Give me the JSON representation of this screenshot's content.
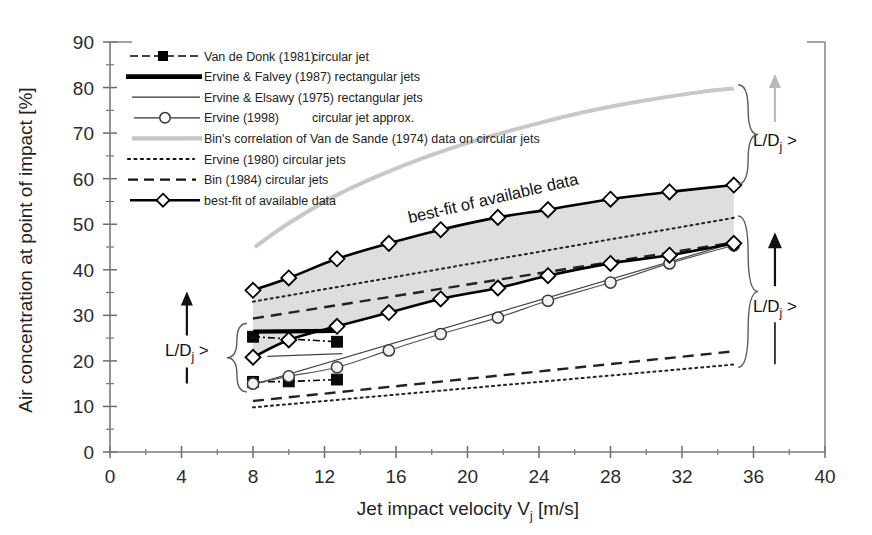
{
  "chart_data": {
    "type": "line",
    "title": "",
    "xlabel": "Jet impact velocity Vj [m/s]",
    "xlabel_main": "Jet impact velocity V",
    "xlabel_sub": "j",
    "xlabel_units": " [m/s]",
    "ylabel": "Air concentration at point of impact [%]",
    "xlim": [
      0,
      40
    ],
    "ylim": [
      0,
      90
    ],
    "xticks": [
      0,
      4,
      8,
      12,
      16,
      20,
      24,
      28,
      32,
      36,
      40
    ],
    "yticks": [
      0,
      10,
      20,
      30,
      40,
      50,
      60,
      70,
      80,
      90
    ],
    "xtick_labels": [
      "0",
      "4",
      "8",
      "12",
      "16",
      "20",
      "24",
      "28",
      "32",
      "36",
      "40"
    ],
    "ytick_labels": [
      "0",
      "10",
      "20",
      "30",
      "40",
      "50",
      "60",
      "70",
      "80",
      "90"
    ],
    "x_minor_step": 2,
    "y_minor_step": 5,
    "grid": false,
    "legend_position": "upper-left inside",
    "annotations": [
      {
        "name": "best-fit-inline-label",
        "text": "best-fit of available data",
        "x": 21.5,
        "y": 54.5,
        "rotation": -13
      },
      {
        "name": "ratio-annotation-left",
        "text": "L/Dj >",
        "text_main": "L/D",
        "text_sub": "j",
        "text_tail": " >",
        "x": 4.3,
        "y": 22.5
      },
      {
        "name": "ratio-annotation-upper-right",
        "text": "L/Dj >",
        "text_main": "L/D",
        "text_sub": "j",
        "text_tail": " >",
        "x": 37.2,
        "y": 68.5
      },
      {
        "name": "ratio-annotation-lower-right",
        "text": "L/Dj >",
        "text_main": "L/D",
        "text_sub": "j",
        "text_tail": " >",
        "x": 37.2,
        "y": 32.0
      }
    ],
    "band": {
      "name": "best-fit-scatter-band",
      "color": "#dcdcdc",
      "upper_x": [
        8.0,
        10.0,
        12.7,
        15.6,
        18.5,
        21.7,
        24.5,
        28.0,
        31.3,
        34.9
      ],
      "upper_y": [
        35.5,
        38.2,
        42.4,
        45.8,
        48.8,
        51.5,
        53.2,
        55.5,
        57.1,
        58.6
      ],
      "lower_x": [
        8.0,
        10.0,
        12.7,
        15.6,
        18.5,
        21.7,
        24.5,
        28.0,
        31.3,
        34.9
      ],
      "lower_y": [
        20.8,
        24.6,
        27.6,
        30.6,
        33.6,
        36.0,
        38.7,
        41.4,
        43.2,
        45.8
      ]
    },
    "series": [
      {
        "name": "Van de Donk (1981) circular jet",
        "key": "van-de-donk-1981",
        "style": "dash-dot-marker-square",
        "color": "#000000",
        "marker": "square-filled",
        "groups": [
          {
            "x": [
              8.0,
              12.7
            ],
            "y": [
              25.3,
              24.2
            ]
          },
          {
            "x": [
              8.0,
              10.0,
              12.7
            ],
            "y": [
              15.4,
              15.5,
              15.9
            ]
          }
        ]
      },
      {
        "name": "Ervine & Falvey (1987) rectangular jets",
        "key": "ervine-falvey-1987",
        "style": "thick-solid",
        "color": "#000000",
        "groups": [
          {
            "x": [
              8.0,
              12.7
            ],
            "y": [
              26.4,
              26.6
            ]
          }
        ]
      },
      {
        "name": "Ervine & Elsawy (1975) rectangular jets",
        "key": "ervine-elsawy-1975",
        "style": "thin-solid",
        "color": "#444444",
        "groups": [
          {
            "x": [
              8.8,
              13.0
            ],
            "y": [
              21.0,
              21.6
            ]
          },
          {
            "x": [
              8.0,
              34.9
            ],
            "y": [
              14.8,
              45.9
            ]
          }
        ]
      },
      {
        "name": "Ervine (1998) circular jet approx.",
        "key": "ervine-1998",
        "style": "thin-solid-marker-circle",
        "color": "#555555",
        "marker": "circle-open",
        "groups": [
          {
            "x": [
              8.0,
              10.0,
              12.7,
              15.6,
              18.5,
              21.7,
              24.5,
              28.0,
              31.3,
              34.9
            ],
            "y": [
              15.0,
              16.6,
              18.6,
              22.3,
              25.9,
              29.5,
              33.2,
              37.2,
              41.4,
              45.4
            ]
          }
        ]
      },
      {
        "name": "Bin's correlation of Van de Sande (1974) data on circular jets",
        "key": "bin-van-de-sande-1974",
        "style": "thick-light-gray-solid",
        "color": "#c8c8c8",
        "groups": [
          {
            "x": [
              8.1,
              10.0,
              12.5,
              15.0,
              18.0,
              21.0,
              24.0,
              27.0,
              30.0,
              33.0,
              34.9
            ],
            "y": [
              45.0,
              50.2,
              56.0,
              60.6,
              65.2,
              69.0,
              72.2,
              75.0,
              77.2,
              79.0,
              79.8
            ]
          }
        ]
      },
      {
        "name": "Ervine (1980) circular jets",
        "key": "ervine-1980",
        "style": "dotted",
        "color": "#222222",
        "groups": [
          {
            "x": [
              8.0,
              34.9
            ],
            "y": [
              33.0,
              51.4
            ]
          },
          {
            "x": [
              8.0,
              34.9
            ],
            "y": [
              9.8,
              19.2
            ]
          }
        ]
      },
      {
        "name": "Bin (1984) circular jets",
        "key": "bin-1984",
        "style": "dashed",
        "color": "#222222",
        "groups": [
          {
            "x": [
              8.0,
              34.9
            ],
            "y": [
              29.3,
              46.0
            ]
          },
          {
            "x": [
              8.0,
              34.9
            ],
            "y": [
              11.2,
              22.1
            ]
          }
        ]
      },
      {
        "name": "best-fit of available data",
        "key": "best-fit",
        "style": "thick-solid-marker-diamond",
        "color": "#000000",
        "marker": "diamond-open",
        "groups": [
          {
            "x": [
              8.0,
              10.0,
              12.7,
              15.6,
              18.5,
              21.7,
              24.5,
              28.0,
              31.3,
              34.9
            ],
            "y": [
              35.5,
              38.2,
              42.4,
              45.8,
              48.8,
              51.5,
              53.2,
              55.5,
              57.1,
              58.6
            ]
          },
          {
            "x": [
              8.0,
              10.0,
              12.7,
              15.6,
              18.5,
              21.7,
              24.5,
              28.0,
              31.3,
              34.9
            ],
            "y": [
              20.8,
              24.6,
              27.6,
              30.6,
              33.6,
              36.0,
              38.7,
              41.4,
              43.2,
              45.8
            ]
          }
        ]
      }
    ]
  },
  "legend": {
    "items": [
      {
        "label": "Van de Donk (1981)",
        "label2": "circular jet",
        "sample": "dash-dot-square"
      },
      {
        "label": "Ervine & Falvey (1987) rectangular jets",
        "label2": "",
        "sample": "thick-solid"
      },
      {
        "label": "Ervine & Elsawy (1975) rectangular jets",
        "label2": "",
        "sample": "thin-solid"
      },
      {
        "label": "Ervine (1998)",
        "label2": "circular jet approx.",
        "sample": "solid-circle"
      },
      {
        "label": "Bin's correlation of Van de Sande (1974) data on circular jets",
        "label2": "",
        "sample": "thick-gray"
      },
      {
        "label": "Ervine (1980) circular jets",
        "label2": "",
        "sample": "dotted"
      },
      {
        "label": "Bin (1984) circular jets",
        "label2": "",
        "sample": "dashed"
      },
      {
        "label": "best-fit of available data",
        "label2": "",
        "sample": "solid-diamond"
      }
    ]
  },
  "colors": {
    "axis": "#6b6b6b",
    "frame": "#7a7a7a",
    "band": "#dcdcdc",
    "gray_curve": "#c8c8c8",
    "text": "#1a1a1a"
  }
}
